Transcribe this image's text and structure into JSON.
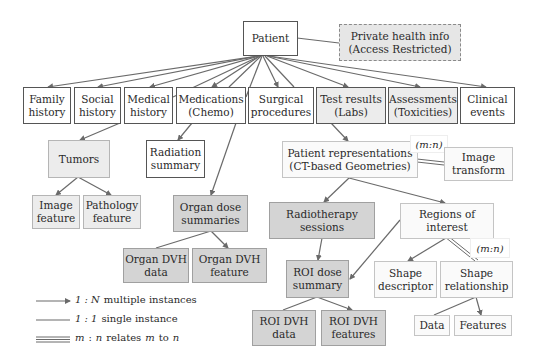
{
  "diagram": {
    "nodes": {
      "patient": "Patient",
      "private_health": "Private health info\n(Access Restricted)",
      "family_history": "Family\nhistory",
      "social_history": "Social\nhistory",
      "medical_history": "Medical\nhistory",
      "medications": "Medications\n(Chemo)",
      "surgical": "Surgical\nprocedures",
      "test_results": "Test results\n(Labs)",
      "assessments": "Assessments\n(Toxicities)",
      "clinical_events": "Clinical\nevents",
      "tumors": "Tumors",
      "radiation_summary": "Radiation\nsummary",
      "patient_representations": "Patient representations\n(CT-based Geometries)",
      "image_transform": "Image\ntransform",
      "image_feature": "Image\nfeature",
      "pathology_feature": "Pathology\nfeature",
      "organ_dose_summaries": "Organ dose\nsummaries",
      "radiotherapy_sessions": "Radiotherapy\nsessions",
      "regions_of_interest": "Regions of\ninterest",
      "organ_dvh_data": "Organ DVH\ndata",
      "organ_dvh_feature": "Organ DVH\nfeature",
      "roi_dose_summary": "ROI dose\nsummary",
      "shape_descriptor": "Shape\ndescriptor",
      "shape_relationship": "Shape\nrelationship",
      "data": "Data",
      "features": "Features",
      "roi_dvh_data": "ROI DVH\ndata",
      "roi_dvh_features": "ROI DVH\nfeatures"
    },
    "mn_labels": {
      "image_transform": "(m:n)",
      "shape_relationship": "(m:n)"
    },
    "colors": {
      "light_fill": "#ececec",
      "mid_fill": "#d4d4d4",
      "line": "#6a6a6a"
    }
  },
  "legend": {
    "one_to_many": {
      "symbol": "1 : N",
      "text": "multiple instances"
    },
    "one_to_one": {
      "symbol": "1 : 1",
      "text": "single instance"
    },
    "many_to_many": {
      "symbol_m": "m",
      "symbol_n": "n",
      "text_a": "relates",
      "text_b": "to"
    }
  }
}
